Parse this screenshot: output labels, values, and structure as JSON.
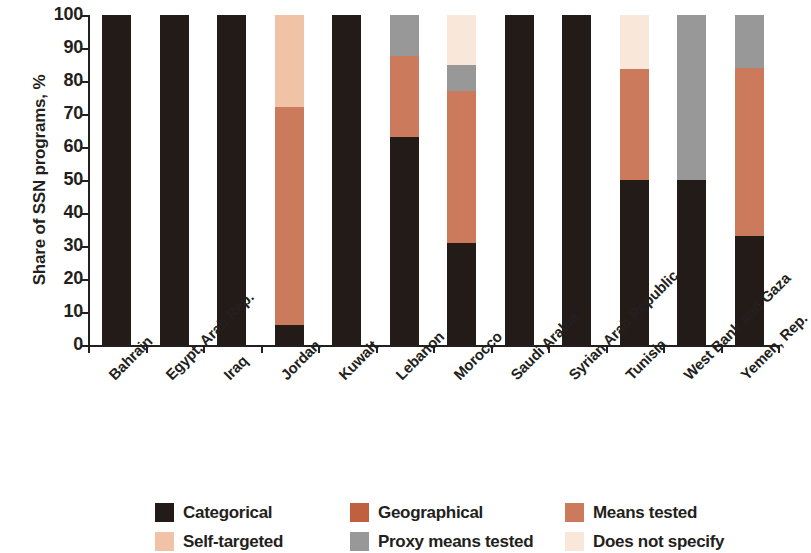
{
  "chart_data": {
    "type": "bar",
    "subtype": "stacked-100-percent",
    "title": "",
    "xlabel": "",
    "ylabel": "Share of SSN programs, %",
    "ylim": [
      0,
      100
    ],
    "yticks": [
      0,
      10,
      20,
      30,
      40,
      50,
      60,
      70,
      80,
      90,
      100
    ],
    "ytick_labels": [
      "0",
      "10",
      "20",
      "30",
      "40",
      "50",
      "60",
      "70",
      "80",
      "90",
      "100"
    ],
    "grid": false,
    "legend_position": "bottom",
    "categories": [
      "Bahrain",
      "Egypt, Arab Rep.",
      "Iraq",
      "Jordan",
      "Kuwait",
      "Lebanon",
      "Morocco",
      "Saudi Arabia",
      "Syrian Arab Republic",
      "Tunisia",
      "West Bank and Gaza",
      "Yemen, Rep."
    ],
    "series": [
      {
        "name": "Categorical",
        "color": "#231b18",
        "values": [
          100,
          100,
          100,
          6,
          100,
          63,
          31,
          100,
          100,
          50,
          50,
          33
        ]
      },
      {
        "name": "Geographical",
        "color": "#c0603e",
        "values": [
          0,
          0,
          0,
          0,
          0,
          0,
          0,
          0,
          0,
          0,
          0,
          0
        ]
      },
      {
        "name": "Means tested",
        "color": "#cc7a5c",
        "values": [
          0,
          0,
          0,
          66,
          0,
          24.5,
          46,
          0,
          0,
          33.5,
          0,
          51
        ]
      },
      {
        "name": "Self-targeted",
        "color": "#f0c3a7",
        "values": [
          0,
          0,
          0,
          28,
          0,
          0,
          0,
          0,
          0,
          0,
          0,
          0
        ]
      },
      {
        "name": "Proxy means tested",
        "color": "#989898",
        "values": [
          0,
          0,
          0,
          0,
          0,
          12.5,
          8,
          0,
          0,
          0,
          50,
          16
        ]
      },
      {
        "name": "Does not specify",
        "color": "#f9e7da",
        "values": [
          0,
          0,
          0,
          0,
          0,
          0,
          15,
          0,
          0,
          16.5,
          0,
          0
        ]
      }
    ]
  },
  "legend": {
    "items": [
      {
        "label": "Categorical",
        "color": "#231b18"
      },
      {
        "label": "Geographical",
        "color": "#c0603e"
      },
      {
        "label": "Means tested",
        "color": "#cc7a5c"
      },
      {
        "label": "Self-targeted",
        "color": "#f0c3a7"
      },
      {
        "label": "Proxy means tested",
        "color": "#989898"
      },
      {
        "label": "Does not specify",
        "color": "#f9e7da"
      }
    ]
  }
}
